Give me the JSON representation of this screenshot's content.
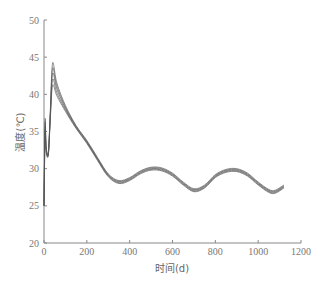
{
  "chart_data": {
    "type": "line",
    "title": "",
    "xlabel": "时间(d)",
    "ylabel": "温度(℃)",
    "xlim": [
      0,
      1200
    ],
    "ylim": [
      20,
      50
    ],
    "xticks": [
      0,
      200,
      400,
      600,
      800,
      1000,
      1200
    ],
    "yticks": [
      20,
      25,
      30,
      35,
      40,
      45,
      50
    ],
    "grid": false,
    "legend": null,
    "series": [
      {
        "name": "curve-1",
        "peak": 44.2,
        "x": [
          0,
          5,
          10,
          20,
          30,
          40,
          60,
          100,
          150,
          200,
          250,
          300,
          350,
          400,
          450,
          500,
          550,
          600,
          650,
          700,
          750,
          800,
          850,
          900,
          950,
          1000,
          1050,
          1080,
          1120
        ],
        "y": [
          25,
          36.5,
          33,
          32,
          38,
          44.2,
          41.5,
          38.5,
          35.8,
          33.8,
          31.5,
          29.3,
          28.4,
          28.8,
          29.7,
          30.2,
          30.1,
          29.4,
          28.2,
          27.3,
          27.8,
          29.2,
          29.9,
          30.0,
          29.4,
          28.2,
          27.2,
          27.1,
          27.8
        ]
      },
      {
        "name": "curve-2",
        "peak": 43.5,
        "x": [
          0,
          5,
          10,
          20,
          30,
          40,
          60,
          100,
          150,
          200,
          250,
          300,
          350,
          400,
          450,
          500,
          550,
          600,
          650,
          700,
          750,
          800,
          850,
          900,
          950,
          1000,
          1050,
          1080,
          1120
        ],
        "y": [
          25,
          36,
          33,
          32,
          37.8,
          43.5,
          41.1,
          38.3,
          35.7,
          33.7,
          31.4,
          29.2,
          28.3,
          28.7,
          29.6,
          30.1,
          30.0,
          29.3,
          28.1,
          27.2,
          27.7,
          29.1,
          29.8,
          29.9,
          29.3,
          28.1,
          27.1,
          27.0,
          27.7
        ]
      },
      {
        "name": "curve-3",
        "peak": 42.8,
        "x": [
          0,
          5,
          10,
          20,
          30,
          40,
          60,
          100,
          150,
          200,
          250,
          300,
          350,
          400,
          450,
          500,
          550,
          600,
          650,
          700,
          750,
          800,
          850,
          900,
          950,
          1000,
          1050,
          1080,
          1120
        ],
        "y": [
          25,
          35.5,
          32.8,
          32,
          37.5,
          42.8,
          40.7,
          38.1,
          35.6,
          33.6,
          31.3,
          29.1,
          28.2,
          28.6,
          29.5,
          30.0,
          29.9,
          29.2,
          28.0,
          27.1,
          27.6,
          29.0,
          29.7,
          29.8,
          29.2,
          28.0,
          27.0,
          26.9,
          27.6
        ]
      },
      {
        "name": "curve-4",
        "peak": 42.0,
        "x": [
          0,
          5,
          10,
          20,
          30,
          40,
          60,
          100,
          150,
          200,
          250,
          300,
          350,
          400,
          450,
          500,
          550,
          600,
          650,
          700,
          750,
          800,
          850,
          900,
          950,
          1000,
          1050,
          1080,
          1120
        ],
        "y": [
          25,
          35,
          32.5,
          31.9,
          37.2,
          42.0,
          40.2,
          37.9,
          35.5,
          33.5,
          31.2,
          29.0,
          28.1,
          28.5,
          29.4,
          29.9,
          29.8,
          29.1,
          27.9,
          27.0,
          27.5,
          28.9,
          29.6,
          29.7,
          29.1,
          27.9,
          26.9,
          26.8,
          27.5
        ]
      },
      {
        "name": "curve-5",
        "peak": 41.2,
        "x": [
          0,
          5,
          10,
          20,
          30,
          40,
          60,
          100,
          150,
          200,
          250,
          300,
          350,
          400,
          450,
          500,
          550,
          600,
          650,
          700,
          750,
          800,
          850,
          900,
          950,
          1000,
          1050,
          1080,
          1120
        ],
        "y": [
          25,
          34.5,
          32.3,
          31.8,
          36.9,
          41.2,
          39.8,
          37.7,
          35.4,
          33.4,
          31.1,
          28.9,
          28.0,
          28.4,
          29.3,
          29.8,
          29.7,
          29.0,
          27.8,
          26.9,
          27.4,
          28.8,
          29.5,
          29.6,
          29.0,
          27.8,
          26.8,
          26.7,
          27.4
        ]
      }
    ]
  },
  "plot": {
    "line_color": "#555555",
    "axis_color": "#888888"
  }
}
